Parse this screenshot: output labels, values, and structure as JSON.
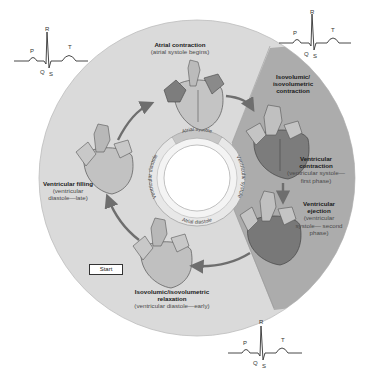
{
  "diagram": {
    "ecg_labels": [
      "P",
      "Q",
      "R",
      "S",
      "T"
    ],
    "inner_ring": {
      "top": "Atrial systole",
      "right": "Ventricular systole",
      "bottom": "Atrial diastole",
      "left": "Ventricular diastole"
    },
    "stages": [
      {
        "id": "atrial-contraction",
        "title": "Atrial contraction",
        "sub": "(atrial systole begins)"
      },
      {
        "id": "isovolumic-contraction",
        "title": "Isovolumic/ isovolumetric contraction",
        "sub": ""
      },
      {
        "id": "ventricular-contraction",
        "title": "Ventricular contraction",
        "sub": "(ventricular systole— first phase)"
      },
      {
        "id": "ventricular-ejection",
        "title": "Ventricular ejection",
        "sub": "(ventricular systole— second phase)"
      },
      {
        "id": "isovolumic-relaxation",
        "title": "Isovolumic/isovolumetric relaxation",
        "sub": "(ventricular diastole—early)"
      },
      {
        "id": "ventricular-filling",
        "title": "Ventricular filling",
        "sub": "(ventricular diastole—late)"
      }
    ],
    "start_label": "Start",
    "colors": {
      "outer_disc": "#d9d9d9",
      "systole_wedge": "#a9a9a9",
      "heart_light": "#bdbdbd",
      "heart_dark": "#7a7a7a",
      "arrow": "#6e6e6e"
    }
  }
}
